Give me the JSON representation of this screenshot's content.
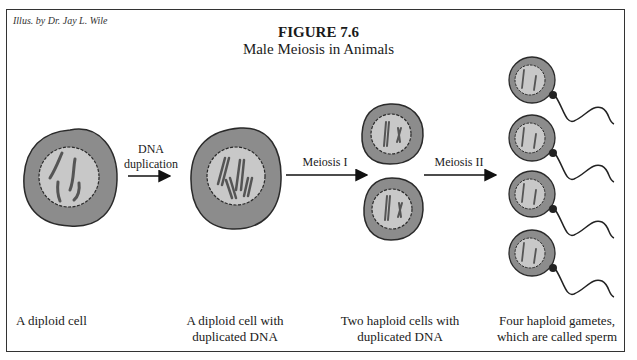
{
  "figure": {
    "credit": "Illus. by Dr. Jay L. Wile",
    "number": "FIGURE 7.6",
    "title": "Male Meiosis in Animals"
  },
  "arrows": [
    {
      "label_line1": "DNA",
      "label_line2": "duplication"
    },
    {
      "label": "Meiosis I"
    },
    {
      "label": "Meiosis II"
    }
  ],
  "stages": [
    {
      "line1": "A diploid cell",
      "line2": ""
    },
    {
      "line1": "A diploid cell with",
      "line2": "duplicated DNA"
    },
    {
      "line1": "Two haploid cells with",
      "line2": "duplicated DNA"
    },
    {
      "line1": "Four haploid gametes,",
      "line2": "which are called sperm"
    }
  ],
  "colors": {
    "cytoplasm": "#8c8c8c",
    "nucleus": "#c8c8c8",
    "outline": "#2a2a2a",
    "chromosome": "#555555"
  }
}
